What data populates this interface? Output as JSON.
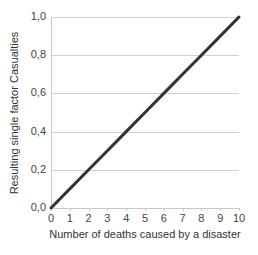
{
  "chart_data": {
    "type": "line",
    "title": "",
    "xlabel": "Number of deaths caused by a disaster",
    "ylabel": "Resulting single factor Casualties",
    "x": [
      0,
      1,
      2,
      3,
      4,
      5,
      6,
      7,
      8,
      9,
      10
    ],
    "series": [
      {
        "name": "Casualties",
        "values": [
          0.0,
          0.1,
          0.2,
          0.3,
          0.4,
          0.5,
          0.6,
          0.7,
          0.8,
          0.9,
          1.0
        ],
        "color": "#333333"
      }
    ],
    "xlim": [
      0,
      10
    ],
    "ylim": [
      0.0,
      1.0
    ],
    "x_ticks": [
      "0",
      "1",
      "2",
      "3",
      "4",
      "5",
      "6",
      "7",
      "8",
      "9",
      "10"
    ],
    "y_ticks": [
      "0,0",
      "0,2",
      "0,4",
      "0,6",
      "0,8",
      "1,0"
    ],
    "grid": {
      "horizontal": true,
      "vertical": false,
      "color": "#d0d0d0"
    },
    "legend": null
  }
}
